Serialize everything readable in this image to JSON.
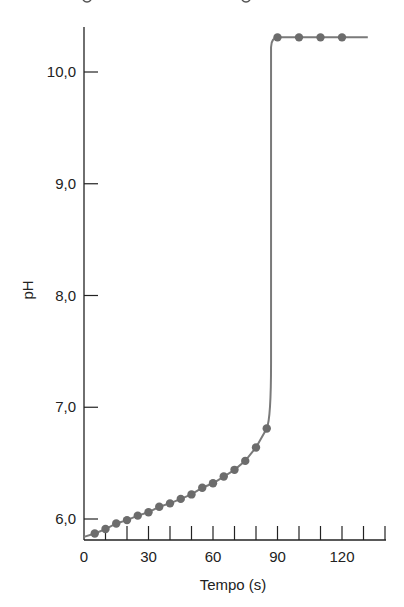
{
  "chart_data": {
    "type": "line",
    "title": "",
    "xlabel": "Tempo (s)",
    "ylabel": "pH",
    "xlim": [
      0,
      140
    ],
    "ylim": [
      5.8,
      10.4
    ],
    "x_ticks": [
      0,
      10,
      20,
      30,
      40,
      50,
      60,
      70,
      80,
      90,
      100,
      110,
      120,
      130,
      140
    ],
    "x_tick_labels": [
      {
        "value": 0,
        "label": "0"
      },
      {
        "value": 30,
        "label": "30"
      },
      {
        "value": 60,
        "label": "60"
      },
      {
        "value": 90,
        "label": "90"
      },
      {
        "value": 120,
        "label": "120"
      }
    ],
    "y_tick_labels": [
      {
        "value": 6.0,
        "label": "6,0"
      },
      {
        "value": 7.0,
        "label": "7,0"
      },
      {
        "value": 8.0,
        "label": "8,0"
      },
      {
        "value": 9.0,
        "label": "9,0"
      },
      {
        "value": 10.0,
        "label": "10,0"
      }
    ],
    "grid": false,
    "legend": null,
    "series": [
      {
        "name": "pH",
        "x": [
          5,
          10,
          15,
          20,
          25,
          30,
          35,
          40,
          45,
          50,
          55,
          60,
          65,
          70,
          75,
          80,
          85,
          90,
          100,
          110,
          120
        ],
        "values": [
          5.87,
          5.91,
          5.96,
          5.99,
          6.03,
          6.06,
          6.11,
          6.14,
          6.18,
          6.22,
          6.28,
          6.32,
          6.38,
          6.44,
          6.52,
          6.64,
          6.81,
          10.31,
          10.31,
          10.31,
          10.31
        ]
      }
    ],
    "curve": {
      "start": [
        0,
        5.84
      ],
      "jump_at_x": 87,
      "end": [
        132,
        10.31
      ]
    }
  },
  "colors": {
    "axis": "#222222",
    "curve": "#7a7a7a",
    "marker": "#6c6c6c",
    "background": "#ffffff"
  }
}
